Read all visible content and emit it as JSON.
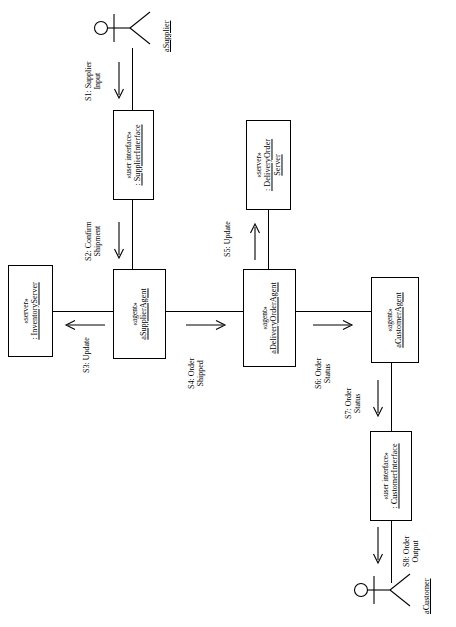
{
  "diagram": {
    "orientation": "rotated-90-ccw",
    "colors": {
      "stroke": "#000000",
      "background": "#ffffff"
    }
  },
  "actors": [
    {
      "id": "supplier",
      "name": "aSupplier"
    },
    {
      "id": "customer",
      "name": "aCustomer"
    }
  ],
  "nodes": [
    {
      "id": "supplier-interface",
      "stereotype": "«user interface»",
      "instance": ": SupplierInterface"
    },
    {
      "id": "supplier-agent",
      "stereotype": "«agent»",
      "instance": "aSupplierAgent"
    },
    {
      "id": "inventory-server",
      "stereotype": "«server»",
      "instance": ": InventoryServer"
    },
    {
      "id": "delivery-order-server",
      "stereotype": "«server»",
      "instance": ": DeliveryOrder Server",
      "instance_line1": ": DeliveryOrder",
      "instance_line2": "Server"
    },
    {
      "id": "delivery-order-agent",
      "stereotype": "«agent»",
      "instance": "aDeliveryOrderAgent"
    },
    {
      "id": "customer-agent",
      "stereotype": "«agent»",
      "instance": "aCustomerAgent"
    },
    {
      "id": "customer-interface",
      "stereotype": "«user interface»",
      "instance": ": CustomerInterface"
    }
  ],
  "messages": [
    {
      "id": "s1",
      "line1": "S1: Supplier",
      "line2": "Input",
      "direction": "down"
    },
    {
      "id": "s2",
      "line1": "S2: Confirm",
      "line2": "Shipment",
      "direction": "down"
    },
    {
      "id": "s3",
      "line1": "S3: Update",
      "line2": "",
      "direction": "left"
    },
    {
      "id": "s4",
      "line1": "S4: Order",
      "line2": "Shipped",
      "direction": "right"
    },
    {
      "id": "s5",
      "line1": "S5: Update",
      "line2": "",
      "direction": "up"
    },
    {
      "id": "s6",
      "line1": "S6: Order",
      "line2": "Status",
      "direction": "right"
    },
    {
      "id": "s7",
      "line1": "S7: Order",
      "line2": "Status",
      "direction": "down"
    },
    {
      "id": "s8",
      "line1": "S8: Order",
      "line2": "Output",
      "direction": "down"
    }
  ]
}
